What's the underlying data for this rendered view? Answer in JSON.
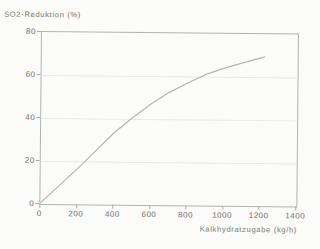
{
  "chart_title": "SO2-Reduktion (%)",
  "x_axis_label": "Kalkhydratzugabe (kg/h)",
  "chart_data": {
    "type": "line",
    "title": "SO2-Reduktion (%)",
    "xlabel": "Kalkhydratzugabe (kg/h)",
    "ylabel": "SO2-Reduktion (%)",
    "xlim": [
      0,
      1400
    ],
    "ylim": [
      0,
      80
    ],
    "x_ticks": [
      0,
      200,
      400,
      600,
      800,
      1000,
      1200,
      1400
    ],
    "y_ticks": [
      0,
      20,
      40,
      60,
      80
    ],
    "grid": "horizontal",
    "gridline_values": [
      20,
      40,
      60
    ],
    "legend_position": "none",
    "series": [
      {
        "name": "SO2-Reduktion",
        "x": [
          0,
          100,
          200,
          300,
          400,
          500,
          600,
          700,
          800,
          900,
          1000,
          1100,
          1200,
          1220
        ],
        "y": [
          0.5,
          8.5,
          16.5,
          25,
          33.5,
          40.5,
          47,
          52.5,
          57,
          61,
          64,
          66.5,
          69,
          69.5
        ]
      }
    ]
  },
  "colors": {
    "background": "#fbfbf9",
    "axis_box": "#b3b3b1",
    "gridline": "#e8e8e5",
    "curve": "#b5b5b3",
    "text": "#8f8f8d"
  }
}
